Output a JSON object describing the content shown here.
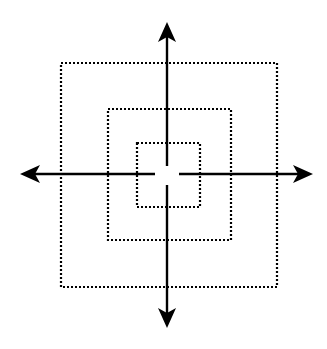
{
  "diagram": {
    "type": "concentric-squares-with-axes",
    "colors": {
      "background": "#ffffff",
      "stroke": "#000000"
    },
    "squares": [
      {
        "name": "outer",
        "x": 61,
        "y": 63,
        "w": 216,
        "h": 224
      },
      {
        "name": "middle",
        "x": 108,
        "y": 109,
        "w": 123,
        "h": 131
      },
      {
        "name": "inner",
        "x": 137,
        "y": 143,
        "w": 63,
        "h": 64
      }
    ],
    "axes": {
      "center": {
        "x": 167,
        "y": 174
      },
      "up_tip_y": 22,
      "down_tip_y": 328,
      "left_tip_x": 20,
      "right_tip_x": 313,
      "gap": {
        "vertical_from": 166,
        "vertical_to": 185,
        "horizontal_from": 155,
        "horizontal_to": 179
      }
    }
  }
}
